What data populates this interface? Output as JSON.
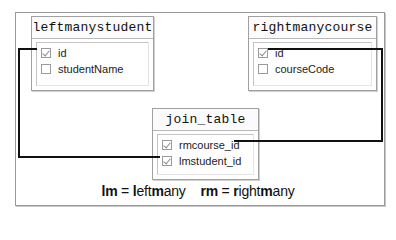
{
  "tables": {
    "left": {
      "title": "leftmanystudent",
      "columns": [
        {
          "name": "id",
          "checked": true
        },
        {
          "name": "studentName",
          "checked": false
        }
      ]
    },
    "right": {
      "title": "rightmanycourse",
      "columns": [
        {
          "name": "id",
          "checked": true
        },
        {
          "name": "courseCode",
          "checked": false
        }
      ]
    },
    "join": {
      "title": "join_table",
      "columns": [
        {
          "name": "rmcourse_id",
          "checked": true
        },
        {
          "name": "lmstudent_id",
          "checked": true
        }
      ]
    }
  },
  "relationships": [
    {
      "from": "leftmanystudent.id",
      "to": "join_table.lmstudent_id"
    },
    {
      "from": "rightmanycourse.id",
      "to": "join_table.rmcourse_id"
    }
  ],
  "legend": {
    "lm_abbr": "lm",
    "lm_eq": " = ",
    "lm_b1": "l",
    "lm_t1": "eft",
    "lm_b2": "m",
    "lm_t2": "any",
    "rm_abbr": "rm",
    "rm_eq": " = ",
    "rm_b1": "r",
    "rm_t1": "ight",
    "rm_b2": "m",
    "rm_t2": "any"
  },
  "colors": {
    "line": "#111111",
    "border": "#a0a0a0"
  }
}
